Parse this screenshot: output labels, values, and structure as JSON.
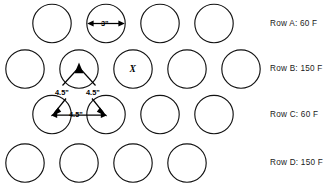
{
  "diagram": {
    "type": "staggered-circle-array",
    "circle_diameter_label": "3\"",
    "spacing_label": "4.5\"",
    "center_marker": "X",
    "rows": [
      {
        "id": "A",
        "label": "Row  A: 60 F",
        "count": 4,
        "offset": "aligned",
        "temperature": "60 F"
      },
      {
        "id": "B",
        "label": "Row  B: 150 F",
        "count": 5,
        "offset": "staggered",
        "temperature": "150 F"
      },
      {
        "id": "C",
        "label": "Row  C: 60 F",
        "count": 4,
        "offset": "aligned",
        "temperature": "60 F"
      },
      {
        "id": "D",
        "label": "Row  D: 150 F",
        "count": 4,
        "offset": "staggered",
        "temperature": "150 F"
      }
    ],
    "annotations": {
      "diameter": "3\"",
      "spacing_left_upper": "4.5\"",
      "spacing_right_upper": "4.5\"",
      "spacing_horizontal": "4.5\"",
      "row_b_left_leg": "4.5\"",
      "row_b_right_leg": "4.5\""
    },
    "colors": {
      "stroke": "#121212",
      "annotation": "#000000",
      "background": "#ffffff"
    }
  }
}
